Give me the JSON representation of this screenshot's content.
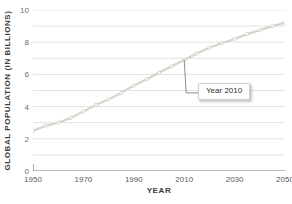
{
  "chart_data": {
    "type": "line",
    "title": "",
    "xlabel": "YEAR",
    "ylabel": "GLOBAL POPULATION (IN BILLIONS)",
    "xlim": [
      1950,
      2050
    ],
    "ylim": [
      0,
      10
    ],
    "grid": true,
    "grid_major_step": 2,
    "grid_minor_step": 1,
    "legend": "none",
    "xticks": [
      1950,
      1970,
      1990,
      2010,
      2030,
      2050
    ],
    "xtick_labels": [
      "1950",
      "1970",
      "1990",
      "2010",
      "2030",
      "2050"
    ],
    "yticks": [
      0,
      2,
      4,
      6,
      8,
      10
    ],
    "ytick_labels": [
      "0",
      "2",
      "4",
      "6",
      "8",
      "10"
    ],
    "series": [
      {
        "name": "Global population",
        "color": "#d8d4cc",
        "marker": "circle",
        "x": [
          1950,
          1955,
          1960,
          1965,
          1970,
          1975,
          1980,
          1985,
          1990,
          1995,
          2000,
          2005,
          2010,
          2015,
          2020,
          2025,
          2030,
          2035,
          2040,
          2045,
          2050
        ],
        "values": [
          2.5,
          2.8,
          3.0,
          3.3,
          3.7,
          4.1,
          4.45,
          4.85,
          5.3,
          5.7,
          6.1,
          6.5,
          6.9,
          7.3,
          7.65,
          7.95,
          8.2,
          8.5,
          8.75,
          9.0,
          9.2
        ]
      }
    ],
    "annotations": [
      {
        "label": "Year 2010",
        "point_x": 2010,
        "point_y": 6.9,
        "leader": true
      }
    ]
  },
  "axes": {
    "x_title": "YEAR",
    "y_title": "GLOBAL POPULATION (IN BILLIONS)"
  },
  "colors": {
    "series_line": "#d8d4cc",
    "grid": "#e2e2e2",
    "axis": "#7a7a7a",
    "tick_text": "#6e6e6e",
    "title_text": "#3d3d3d",
    "callout_border": "#cfcfcf",
    "callout_bg": "#ffffff",
    "leader": "#8d8d8d"
  }
}
